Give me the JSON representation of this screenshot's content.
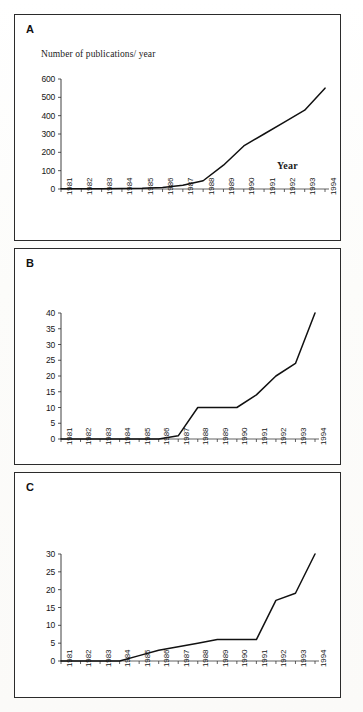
{
  "figure": {
    "panels": [
      {
        "letter": "A",
        "ylabel": "Number of publications/ year",
        "xlabel": "Year"
      },
      {
        "letter": "B",
        "ylabel": "",
        "xlabel": ""
      },
      {
        "letter": "C",
        "ylabel": "",
        "xlabel": ""
      }
    ]
  },
  "chart_data": [
    {
      "type": "line",
      "title": "A",
      "xlabel": "Year",
      "ylabel": "Number of publications/ year",
      "x": [
        1981,
        1982,
        1983,
        1984,
        1985,
        1986,
        1987,
        1988,
        1989,
        1990,
        1991,
        1992,
        1993,
        1994
      ],
      "categories": [
        "1981",
        "1982",
        "1983",
        "1984",
        "1985",
        "1986",
        "1987",
        "1988",
        "1989",
        "1990",
        "1991",
        "1992",
        "1993",
        "1994"
      ],
      "values": [
        2,
        2,
        2,
        3,
        4,
        8,
        20,
        45,
        130,
        235,
        300,
        365,
        430,
        550
      ],
      "yticks": [
        0,
        100,
        200,
        300,
        400,
        500,
        600
      ],
      "ylim": [
        0,
        600
      ],
      "grid": false,
      "legend": false
    },
    {
      "type": "line",
      "title": "B",
      "xlabel": "",
      "ylabel": "",
      "x": [
        1981,
        1982,
        1983,
        1984,
        1985,
        1986,
        1987,
        1988,
        1989,
        1990,
        1991,
        1992,
        1993,
        1994
      ],
      "categories": [
        "1981",
        "1982",
        "1983",
        "1984",
        "1985",
        "1986",
        "1987",
        "1988",
        "1989",
        "1990",
        "1991",
        "1992",
        "1993",
        "1994"
      ],
      "values": [
        0,
        0,
        0,
        0,
        0,
        0,
        1,
        10,
        10,
        10,
        14,
        20,
        24,
        40
      ],
      "yticks": [
        0,
        5,
        10,
        15,
        20,
        25,
        30,
        35,
        40
      ],
      "ylim": [
        0,
        40
      ],
      "grid": false,
      "legend": false
    },
    {
      "type": "line",
      "title": "C",
      "xlabel": "",
      "ylabel": "",
      "x": [
        1981,
        1982,
        1983,
        1984,
        1985,
        1986,
        1987,
        1988,
        1989,
        1990,
        1991,
        1992,
        1993,
        1994
      ],
      "categories": [
        "1981",
        "1982",
        "1983",
        "1984",
        "1985",
        "1986",
        "1987",
        "1988",
        "1989",
        "1990",
        "1991",
        "1992",
        "1993",
        "1994"
      ],
      "values": [
        0,
        0,
        0,
        0,
        1.5,
        3,
        4,
        5,
        6,
        6,
        6,
        17,
        19,
        30
      ],
      "yticks": [
        0,
        5,
        10,
        15,
        20,
        25,
        30
      ],
      "ylim": [
        0,
        30
      ],
      "grid": false,
      "legend": false
    }
  ]
}
